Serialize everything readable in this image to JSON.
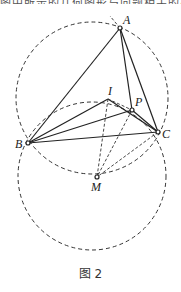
{
  "top_text": "图中所示的几何图形与问题相关的构造说明",
  "figure": {
    "caption": "图 2",
    "points": {
      "A": {
        "label": "A",
        "x": 120,
        "y": 28
      },
      "B": {
        "label": "B",
        "x": 28,
        "y": 143
      },
      "C": {
        "label": "C",
        "x": 158,
        "y": 132
      },
      "I": {
        "label": "I",
        "x": 108,
        "y": 99
      },
      "P": {
        "label": "P",
        "x": 132,
        "y": 110
      },
      "M": {
        "label": "M",
        "x": 97,
        "y": 177
      }
    },
    "circles": [
      {
        "name": "circumcircle-ABC",
        "cx": 92,
        "cy": 98,
        "r": 76
      },
      {
        "name": "circle-BIC",
        "cx": 92,
        "cy": 176,
        "r": 74
      }
    ]
  }
}
